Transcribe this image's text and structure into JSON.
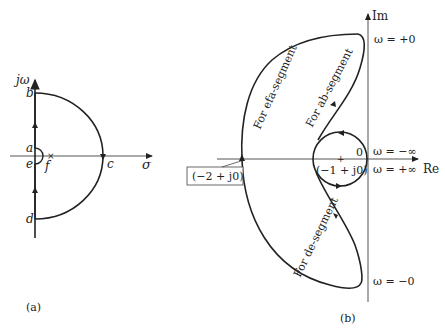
{
  "panel_a": {
    "caption": "(a)",
    "axes": {
      "vertical": "jω",
      "horizontal": "σ"
    },
    "points": {
      "a": "a",
      "b": "b",
      "c": "c",
      "d": "d",
      "e": "e",
      "f": "f"
    }
  },
  "panel_b": {
    "caption": "(b)",
    "axes": {
      "vertical": "Im",
      "horizontal": "Re"
    },
    "omega_labels": {
      "plus_zero": "ω = +0",
      "minus_inf": "ω = −∞",
      "plus_inf": "ω = +∞",
      "minus_zero": "ω = −0"
    },
    "origin": "0",
    "critical_point": "(−1 + j0)",
    "crossing_point": "(−2 + j0)",
    "segments": {
      "efa": "For efa-segment",
      "ab": "For ab-segment",
      "de": "For de-segment"
    }
  }
}
